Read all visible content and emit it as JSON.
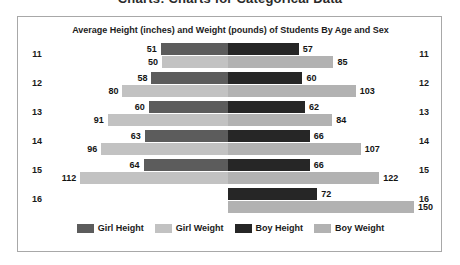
{
  "page_heading": "Charts: Charts for Categorical Data",
  "chart_title": "Average Height (inches) and Weight (pounds) of Students By Age and Sex",
  "legend": [
    {
      "label": "Girl Height",
      "key": "girl-height",
      "color": "#5c5c5c"
    },
    {
      "label": "Girl Weight",
      "key": "girl-weight",
      "color": "#c2c2c2"
    },
    {
      "label": "Boy Height",
      "key": "boy-height",
      "color": "#262626"
    },
    {
      "label": "Boy Weight",
      "key": "boy-weight",
      "color": "#b2b2b2"
    }
  ],
  "chart_data": {
    "type": "bar",
    "title": "Average Height (inches) and Weight (pounds) of Students By Age and Sex",
    "orientation": "horizontal-diverging",
    "xlabel": "",
    "ylabel": "Age",
    "categories": [
      "11",
      "12",
      "13",
      "14",
      "15",
      "16"
    ],
    "grid": false,
    "legend_position": "bottom",
    "series": [
      {
        "name": "Girl Height",
        "side": "left",
        "unit": "inches",
        "values": [
          51,
          58,
          60,
          63,
          64,
          null
        ]
      },
      {
        "name": "Girl Weight",
        "side": "left",
        "unit": "pounds",
        "values": [
          50,
          80,
          91,
          96,
          112,
          null
        ]
      },
      {
        "name": "Boy Height",
        "side": "right",
        "unit": "inches",
        "values": [
          57,
          60,
          62,
          66,
          66,
          72
        ]
      },
      {
        "name": "Boy Weight",
        "side": "right",
        "unit": "pounds",
        "values": [
          85,
          103,
          84,
          107,
          122,
          150
        ]
      }
    ],
    "rows": [
      {
        "age": "11",
        "girl_height": 51,
        "boy_height": 57,
        "girl_weight": 50,
        "boy_weight": 85,
        "girl_height_label": "51",
        "boy_height_label": "57",
        "girl_weight_label": "50",
        "boy_weight_label": "85"
      },
      {
        "age": "12",
        "girl_height": 58,
        "boy_height": 60,
        "girl_weight": 80,
        "boy_weight": 103,
        "girl_height_label": "58",
        "boy_height_label": "60",
        "girl_weight_label": "80",
        "boy_weight_label": "103"
      },
      {
        "age": "13",
        "girl_height": 60,
        "boy_height": 62,
        "girl_weight": 91,
        "boy_weight": 84,
        "girl_height_label": "60",
        "boy_height_label": "62",
        "girl_weight_label": "91",
        "boy_weight_label": "84"
      },
      {
        "age": "14",
        "girl_height": 63,
        "boy_height": 66,
        "girl_weight": 96,
        "boy_weight": 107,
        "girl_height_label": "63",
        "boy_height_label": "66",
        "girl_weight_label": "96",
        "boy_weight_label": "107"
      },
      {
        "age": "15",
        "girl_height": 64,
        "boy_height": 66,
        "girl_weight": 112,
        "boy_weight": 122,
        "girl_height_label": "64",
        "boy_height_label": "66",
        "girl_weight_label": "112",
        "boy_weight_label": "122"
      },
      {
        "age": "16",
        "girl_height": 0,
        "boy_height": 72,
        "girl_weight": 0,
        "boy_weight": 150,
        "girl_height_label": "",
        "boy_height_label": "72",
        "girl_weight_label": "",
        "boy_weight_label": "150"
      }
    ]
  }
}
